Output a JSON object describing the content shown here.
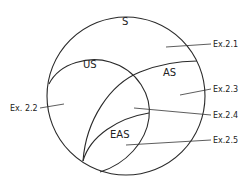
{
  "diagram": {
    "type": "nested-set-venn",
    "sets": [
      {
        "id": "S",
        "label": "S"
      },
      {
        "id": "US",
        "label": "US"
      },
      {
        "id": "AS",
        "label": "AS"
      },
      {
        "id": "EAS",
        "label": "EAS"
      }
    ],
    "callouts": [
      {
        "id": "ex21",
        "label": "Ex.2.1"
      },
      {
        "id": "ex22",
        "label": "Ex. 2.2"
      },
      {
        "id": "ex23",
        "label": "Ex.2.3"
      },
      {
        "id": "ex24",
        "label": "Ex.2.4"
      },
      {
        "id": "ex25",
        "label": "Ex.2.5"
      }
    ],
    "stroke_color": "#2a2a2a",
    "background": "#ffffff"
  }
}
